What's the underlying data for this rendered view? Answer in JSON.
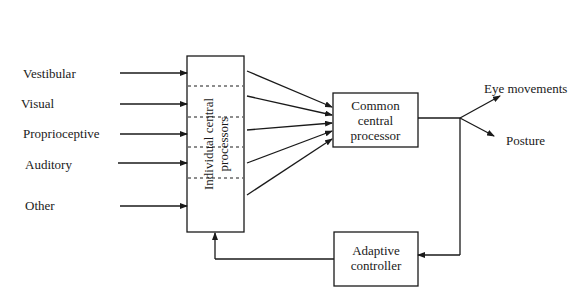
{
  "inputs": [
    {
      "label": "Vestibular"
    },
    {
      "label": "Visual"
    },
    {
      "label": "Proprioceptive"
    },
    {
      "label": "Auditory"
    },
    {
      "label": "Other"
    }
  ],
  "blocks": {
    "individual": {
      "line1": "Individual central",
      "line2": "processors"
    },
    "common": {
      "line1": "Common",
      "line2": "central",
      "line3": "processor"
    },
    "adaptive": {
      "line1": "Adaptive",
      "line2": "controller"
    }
  },
  "outputs": [
    {
      "label": "Eye movements"
    },
    {
      "label": "Posture"
    }
  ],
  "colors": {
    "line": "#1a1a1a",
    "background": "#ffffff"
  }
}
